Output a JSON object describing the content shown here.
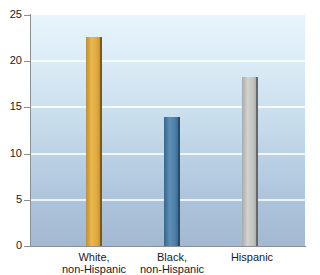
{
  "chart_data": {
    "type": "bar",
    "title": "",
    "subtitle": "",
    "xlabel": "",
    "ylabel": "",
    "categories": [
      "White,\nnon-Hispanic",
      "Black,\nnon-Hispanic",
      "Hispanic"
    ],
    "category_lines": [
      [
        "White,",
        "non-Hispanic"
      ],
      [
        "Black,",
        "non-Hispanic"
      ],
      [
        "Hispanic",
        ""
      ]
    ],
    "values": [
      22.6,
      14.0,
      18.3
    ],
    "bar_colors": [
      "#dda83f",
      "#4e7fa6",
      "#c3c3c0"
    ],
    "ylim": [
      0,
      25
    ],
    "yticks": [
      0,
      5,
      10,
      15,
      20,
      25
    ],
    "ytick_labels": [
      "0",
      "5",
      "10",
      "15",
      "20",
      "25"
    ],
    "grid": true,
    "grid_color": "#ffffff",
    "legend": "none",
    "legend_position": "none",
    "plot_background_top": "#e8f4fa",
    "plot_background_bottom": "#a3b9d1",
    "axis_color": "#8a8f94",
    "text_color": "#1a1a1a"
  },
  "geometry": {
    "bar_width_px": 16,
    "bar_centers_px": [
      94,
      172,
      250
    ],
    "label_centers_px": [
      94,
      172,
      252
    ]
  }
}
